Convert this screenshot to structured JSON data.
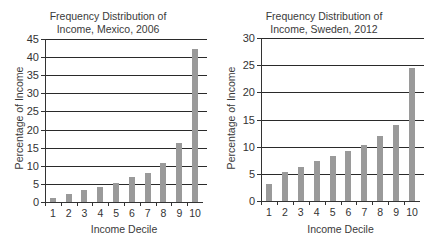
{
  "chart_data": [
    {
      "type": "bar",
      "title": "Frequency Distribution of Income, Mexico, 2006",
      "title_lines": [
        "Frequency Distribution of",
        "Income, Mexico, 2006"
      ],
      "xlabel": "Income Decile",
      "ylabel": "Percentage of Income",
      "categories": [
        "1",
        "2",
        "3",
        "4",
        "5",
        "6",
        "7",
        "8",
        "9",
        "10"
      ],
      "values": [
        1.2,
        2.3,
        3.2,
        4.2,
        5.3,
        6.8,
        8.0,
        10.9,
        16.2,
        42.3
      ],
      "ylim": [
        0,
        45
      ],
      "yticks": [
        "0",
        "5",
        "10",
        "15",
        "20",
        "25",
        "30",
        "35",
        "40",
        "45"
      ],
      "grid": true,
      "bar_color": "#9a9a9a"
    },
    {
      "type": "bar",
      "title": "Frequency Distribution of Income, Sweden, 2012",
      "title_lines": [
        "Frequency Distribution of",
        "Income, Sweden, 2012"
      ],
      "xlabel": "Income Decile",
      "ylabel": "Percentage of Income",
      "categories": [
        "1",
        "2",
        "3",
        "4",
        "5",
        "6",
        "7",
        "8",
        "9",
        "10"
      ],
      "values": [
        3.1,
        5.3,
        6.3,
        7.4,
        8.3,
        9.2,
        10.3,
        11.9,
        13.9,
        24.5
      ],
      "ylim": [
        0,
        30
      ],
      "yticks": [
        "0",
        "5",
        "10",
        "15",
        "20",
        "25",
        "30"
      ],
      "grid": true,
      "bar_color": "#9a9a9a"
    }
  ]
}
